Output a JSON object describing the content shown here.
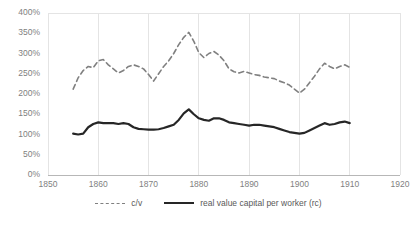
{
  "chart_data": {
    "type": "line",
    "title": "",
    "xlabel": "",
    "ylabel": "",
    "xlim": [
      1850,
      1920
    ],
    "ylim": [
      0,
      400
    ],
    "ytick_labels": [
      "400%",
      "350%",
      "300%",
      "250%",
      "200%",
      "150%",
      "100%",
      "50%",
      "0%"
    ],
    "ytick_values": [
      400,
      350,
      300,
      250,
      200,
      150,
      100,
      50,
      0
    ],
    "xtick_labels": [
      "1850",
      "1860",
      "1870",
      "1880",
      "1890",
      "1900",
      "1910",
      "1920"
    ],
    "xtick_values": [
      1850,
      1860,
      1870,
      1880,
      1890,
      1900,
      1910,
      1920
    ],
    "grid": "vertical",
    "legend_position": "bottom",
    "x": [
      1855,
      1856,
      1857,
      1858,
      1859,
      1860,
      1861,
      1862,
      1863,
      1864,
      1865,
      1866,
      1867,
      1868,
      1869,
      1870,
      1871,
      1872,
      1873,
      1874,
      1875,
      1876,
      1877,
      1878,
      1879,
      1880,
      1881,
      1882,
      1883,
      1884,
      1885,
      1886,
      1887,
      1888,
      1889,
      1890,
      1891,
      1892,
      1893,
      1894,
      1895,
      1896,
      1897,
      1898,
      1899,
      1900,
      1901,
      1902,
      1903,
      1904,
      1905,
      1906,
      1907,
      1908,
      1909,
      1910
    ],
    "series": [
      {
        "name": "c/v",
        "style": "dashed",
        "color": "#808080",
        "values": [
          212,
          240,
          258,
          268,
          265,
          282,
          285,
          272,
          262,
          252,
          258,
          268,
          272,
          268,
          262,
          248,
          232,
          250,
          268,
          282,
          300,
          322,
          340,
          352,
          330,
          302,
          290,
          300,
          305,
          296,
          282,
          262,
          255,
          252,
          256,
          252,
          248,
          246,
          242,
          240,
          238,
          232,
          228,
          222,
          212,
          202,
          212,
          228,
          244,
          262,
          276,
          268,
          262,
          268,
          272,
          266
        ]
      },
      {
        "name": "real value capital per worker (rc)",
        "style": "solid",
        "color": "#262626",
        "values": [
          102,
          100,
          102,
          118,
          126,
          130,
          128,
          128,
          128,
          126,
          128,
          126,
          118,
          114,
          113,
          112,
          112,
          113,
          116,
          120,
          124,
          136,
          152,
          162,
          150,
          140,
          136,
          134,
          140,
          140,
          136,
          130,
          128,
          126,
          124,
          122,
          124,
          124,
          122,
          120,
          118,
          114,
          110,
          106,
          104,
          102,
          104,
          110,
          116,
          122,
          128,
          124,
          126,
          130,
          132,
          128
        ]
      }
    ]
  },
  "legend": {
    "items": [
      {
        "label": "c/v"
      },
      {
        "label": "real value capital per worker (rc)"
      }
    ]
  }
}
